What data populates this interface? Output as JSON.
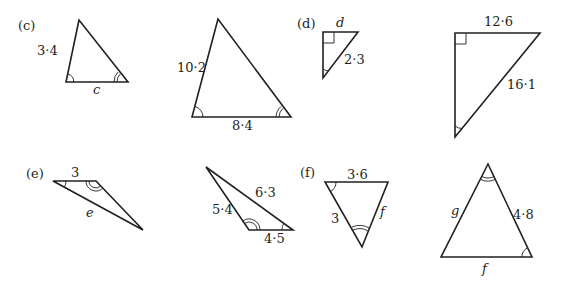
{
  "parts": {
    "c": {
      "label": "(c)",
      "small": {
        "side_left": "3·4",
        "side_bottom": "c"
      },
      "large": {
        "side_left": "10·2",
        "side_bottom": "8·4"
      }
    },
    "d": {
      "label": "(d)",
      "small": {
        "side_top": "d",
        "hypotenuse": "2·3"
      },
      "large": {
        "side_top": "12·6",
        "hypotenuse": "16·1"
      }
    },
    "e": {
      "label": "(e)",
      "small": {
        "side_top": "3",
        "side_long": "e"
      },
      "large": {
        "side_left": "5·4",
        "side_long": "6·3",
        "side_bottom": "4·5"
      }
    },
    "f": {
      "label": "(f)",
      "small": {
        "side_top": "3·6",
        "side_left": "3",
        "side_right": "f"
      },
      "large": {
        "side_left": "g",
        "side_right": "4·8",
        "side_bottom": "f"
      }
    }
  },
  "colors": {
    "ink": "#231f20",
    "background": "#ffffff"
  }
}
